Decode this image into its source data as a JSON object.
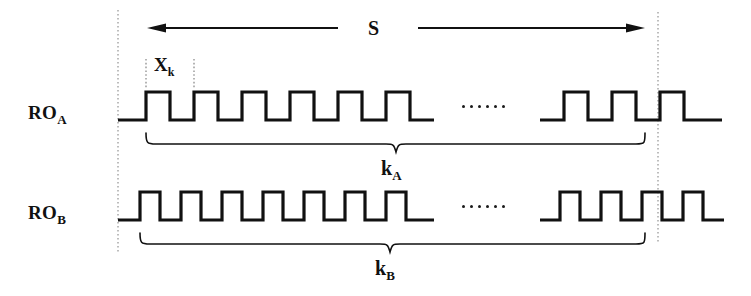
{
  "figure": {
    "type": "timing-diagram",
    "stroke_color": "#111111",
    "guide_color": "#999999",
    "background": "#ffffff"
  },
  "labels": {
    "signal_a": "RO",
    "signal_a_sub": "A",
    "signal_b": "RO",
    "signal_b_sub": "B",
    "period_marker": "X",
    "period_marker_sub": "k",
    "window": "S",
    "count_a": "k",
    "count_a_sub": "A",
    "count_b": "k",
    "count_b_sub": "B"
  },
  "ellipsis": {
    "dot_count": 6,
    "glyph": "......"
  },
  "chart_data": {
    "type": "line",
    "xlabel": "",
    "ylabel": "",
    "grid": false,
    "legend": null,
    "annotations": [
      {
        "name": "sampling-window",
        "text": "S",
        "kind": "double-arrow-span",
        "x_start": 118,
        "x_end": 658
      },
      {
        "name": "period-marker",
        "text": "X_k",
        "kind": "period-bracket",
        "x_start": 146,
        "x_end": 194
      },
      {
        "name": "count-a-brace",
        "text": "k_A",
        "kind": "brace",
        "x_start": 146,
        "x_end": 645
      },
      {
        "name": "count-b-brace",
        "text": "k_B",
        "kind": "brace",
        "x_start": 140,
        "x_end": 645
      }
    ],
    "guides": [
      {
        "name": "window-start",
        "x": 118,
        "style": "dotted"
      },
      {
        "name": "window-end",
        "x": 658,
        "style": "dotted"
      }
    ],
    "series": [
      {
        "name": "RO_A",
        "kind": "square-wave",
        "period_px": 48,
        "duty_cycle": 0.5,
        "baseline_y": 120,
        "high_y": 92,
        "pulses_left": 6,
        "pulses_right": 3,
        "has_gap": true
      },
      {
        "name": "RO_B",
        "kind": "square-wave",
        "period_px": 41,
        "duty_cycle": 0.5,
        "baseline_y": 220,
        "high_y": 192,
        "pulses_left": 7,
        "pulses_right": 4,
        "has_gap": true
      }
    ]
  }
}
